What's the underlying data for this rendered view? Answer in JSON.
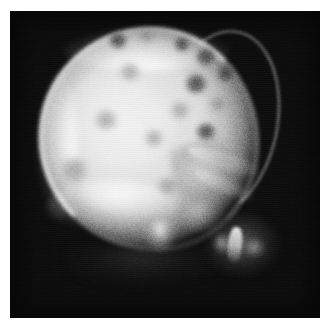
{
  "figure": {
    "domain": "medical-radiograph",
    "modality": "Plain film radiograph",
    "view": "Lateral skull",
    "caption": "",
    "alt_text": "Lateral skull radiograph showing multiple rounded punched-out lucent lesions throughout the cranial vault",
    "width_px": 331,
    "height_px": 331
  },
  "plate": {
    "border_color": "#ffffff",
    "background_color": "#0d0d0d",
    "left_px": 10,
    "top_px": 11,
    "width_px": 310,
    "height_px": 307
  },
  "palette": {
    "film_background": "#0d0d0d",
    "bone_bright": "#f3f3f3",
    "bone_mid": "#c2c2c2",
    "lesion_dark": "#3c3c3c",
    "paper_white": "#ffffff"
  },
  "anatomy": {
    "regions": [
      {
        "name": "cranial-vault",
        "label": "Cranial vault"
      },
      {
        "name": "calvarial-rim",
        "label": "Calvarial outer table"
      },
      {
        "name": "occiput",
        "label": "Occiput"
      },
      {
        "name": "skull-base",
        "label": "Skull base"
      },
      {
        "name": "facial-bones",
        "label": "Facial bones"
      },
      {
        "name": "petrous-ridge",
        "label": "Petrous ridge"
      },
      {
        "name": "sella-region",
        "label": "Sella turcica region"
      },
      {
        "name": "mastoid",
        "label": "Mastoid / temporal bone"
      },
      {
        "name": "mandible-ramus",
        "label": "Mandibular ramus"
      }
    ]
  },
  "lesions": {
    "description": "Multiple rounded lucencies of the calvarium",
    "count": 14,
    "items": [
      {
        "id": 1,
        "cx": 108,
        "cy": 30,
        "r": 9,
        "intensity": "strong"
      },
      {
        "id": 2,
        "cx": 137,
        "cy": 26,
        "r": 7,
        "intensity": "faint"
      },
      {
        "id": 3,
        "cx": 172,
        "cy": 34,
        "r": 8,
        "intensity": "strong"
      },
      {
        "id": 4,
        "cx": 196,
        "cy": 47,
        "r": 10,
        "intensity": "strong"
      },
      {
        "id": 5,
        "cx": 216,
        "cy": 63,
        "r": 9,
        "intensity": "strong"
      },
      {
        "id": 6,
        "cx": 186,
        "cy": 74,
        "r": 11,
        "intensity": "strong"
      },
      {
        "id": 7,
        "cx": 208,
        "cy": 94,
        "r": 8,
        "intensity": "faint"
      },
      {
        "id": 8,
        "cx": 170,
        "cy": 100,
        "r": 9,
        "intensity": "faint"
      },
      {
        "id": 9,
        "cx": 196,
        "cy": 122,
        "r": 10,
        "intensity": "strong"
      },
      {
        "id": 10,
        "cx": 120,
        "cy": 62,
        "r": 10,
        "intensity": "faint"
      },
      {
        "id": 11,
        "cx": 96,
        "cy": 110,
        "r": 11,
        "intensity": "faint"
      },
      {
        "id": 12,
        "cx": 144,
        "cy": 128,
        "r": 9,
        "intensity": "faint"
      },
      {
        "id": 13,
        "cx": 64,
        "cy": 160,
        "r": 13,
        "intensity": "faint"
      },
      {
        "id": 14,
        "cx": 158,
        "cy": 176,
        "r": 10,
        "intensity": "faint"
      }
    ]
  },
  "texture": {
    "film_grain": true,
    "grain_opacity": 0.3,
    "scan_lines": true
  }
}
